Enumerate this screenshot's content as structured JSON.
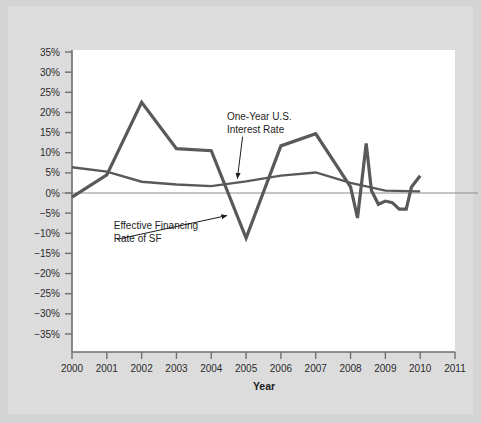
{
  "figure": {
    "background_color": "#d4d4d4",
    "inner_background_color": "#dcdcdc",
    "plot_background_color": "#ffffff",
    "axis_color": "#6f6f6f",
    "zero_line_color": "#8c8c8c"
  },
  "chart_data": {
    "type": "line",
    "title": "",
    "subtitle": "",
    "xlabel": "Year",
    "ylabel": "",
    "xlim": [
      2000,
      2011
    ],
    "ylim": [
      -35,
      35
    ],
    "grid": false,
    "legend_position": "inline-annotations",
    "x_tick_labels": [
      "2000",
      "2001",
      "2002",
      "2003",
      "2004",
      "2005",
      "2006",
      "2007",
      "2008",
      "2009",
      "2010",
      "2011"
    ],
    "x_ticks": [
      2000,
      2001,
      2002,
      2003,
      2004,
      2005,
      2006,
      2007,
      2008,
      2009,
      2010,
      2011
    ],
    "y_tick_labels": [
      "35%",
      "30%",
      "25%",
      "20%",
      "15%",
      "10%",
      "5%",
      "0%",
      "−5%",
      "−10%",
      "−15%",
      "−20%",
      "−25%",
      "−30%",
      "−35%"
    ],
    "y_ticks": [
      35,
      30,
      25,
      20,
      15,
      10,
      5,
      0,
      -5,
      -10,
      -15,
      -20,
      -25,
      -30,
      -35
    ],
    "series": [
      {
        "name": "Effective Financing Rate of SF",
        "color": "#58595b",
        "line_width": 3.2,
        "x": [
          2000.0,
          2001.0,
          2002.0,
          2003.0,
          2004.0,
          2005.0,
          2006.0,
          2007.0,
          2008.0,
          2008.2,
          2008.45,
          2008.6,
          2008.8,
          2009.0,
          2009.2,
          2009.4,
          2009.6,
          2009.75,
          2010.0
        ],
        "values": [
          -1.0,
          4.5,
          22.5,
          11.0,
          10.5,
          -11.2,
          11.7,
          14.7,
          1.5,
          -6.2,
          12.3,
          0.6,
          -2.8,
          -2.0,
          -2.4,
          -4.0,
          -4.0,
          1.5,
          4.3
        ]
      },
      {
        "name": "One-Year U.S. Interest Rate",
        "color": "#58595b",
        "line_width": 2.4,
        "x": [
          2000.0,
          2001.0,
          2002.0,
          2003.0,
          2004.0,
          2005.0,
          2006.0,
          2007.0,
          2008.0,
          2009.0,
          2010.0
        ],
        "values": [
          6.4,
          5.3,
          2.8,
          2.1,
          1.7,
          2.9,
          4.3,
          5.1,
          2.5,
          0.6,
          0.4
        ]
      }
    ],
    "annotations": [
      {
        "id": "one-year-rate",
        "lines": [
          "One-Year U.S.",
          "Interest Rate"
        ],
        "text_x": 2004.45,
        "text_y": 18.0,
        "arrow_from_x": 2004.9,
        "arrow_from_y": 14.0,
        "arrow_to_x": 2004.75,
        "arrow_to_y": 3.6
      },
      {
        "id": "effective-financing-rate",
        "lines": [
          "Effective Financing",
          "Rate of SF"
        ],
        "text_x": 2001.2,
        "text_y": -9.0,
        "arrow_from_x": 2001.3,
        "arrow_from_y": -11.5,
        "arrow_to_x": 2004.45,
        "arrow_to_y": -5.6
      }
    ]
  }
}
